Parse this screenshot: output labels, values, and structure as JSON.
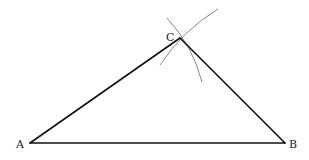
{
  "diagram": {
    "points": {
      "A": {
        "label": "A",
        "x": 30,
        "y": 143
      },
      "B": {
        "label": "B",
        "x": 285,
        "y": 143
      },
      "C": {
        "label": "C",
        "x": 180,
        "y": 38
      }
    },
    "labels": {
      "A": "A",
      "B": "B",
      "C": "C"
    },
    "segments": [
      "AB",
      "BC",
      "CA"
    ],
    "arcs": [
      {
        "center": "A",
        "through": "C",
        "from": [
          160,
          65
        ],
        "to": [
          218,
          9
        ]
      },
      {
        "center": "B",
        "through": "C",
        "from": [
          167,
          18
        ],
        "to": [
          202,
          82
        ]
      }
    ],
    "colors": {
      "edge": "#111111",
      "arc": "#777777",
      "background": "#ffffff"
    }
  }
}
